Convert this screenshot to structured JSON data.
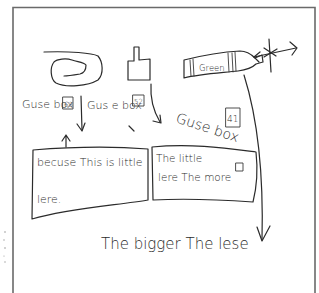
{
  "page": {
    "background": "#ffffff",
    "ink_color": "#2b2b2b",
    "frame_color": "#6a6a6a"
  },
  "objects": [
    {
      "id": "object-1",
      "description": "rounded loop shape"
    },
    {
      "id": "object-2",
      "description": "square with raised tab"
    },
    {
      "id": "object-3",
      "description": "bottle-shaped object",
      "label": "Green"
    }
  ],
  "guess_labels": [
    {
      "text": "Guse box",
      "value": "63"
    },
    {
      "text": "Gus e box",
      "value": "52"
    },
    {
      "text": "Guse box",
      "value": "41"
    }
  ],
  "notes": {
    "box_left": {
      "line1": "becuse  This is little",
      "line2": "lere."
    },
    "box_right": {
      "line1": "The little",
      "line2": "lere  The more"
    },
    "conclusion": "The  bigger  The  lese"
  }
}
